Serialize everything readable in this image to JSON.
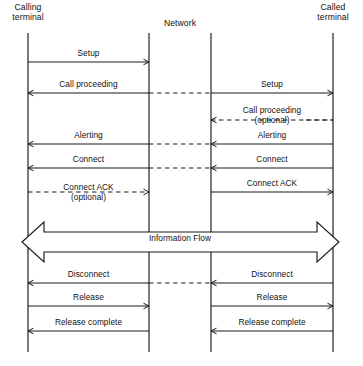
{
  "diagram": {
    "type": "sequence-diagram",
    "colors": {
      "line": "#1a1a1a",
      "text": "#111111",
      "background": "#ffffff"
    }
  },
  "lifelines": [
    {
      "id": "calling-terminal",
      "label": "Calling\nterminal",
      "x": 28,
      "label_x": 28,
      "label_y": 4,
      "top": 33,
      "bottom": 352
    },
    {
      "id": "network-left",
      "label": "",
      "x": 149,
      "top": 33,
      "bottom": 352
    },
    {
      "id": "network-right",
      "label": "",
      "x": 211,
      "top": 33,
      "bottom": 352
    },
    {
      "id": "called-terminal",
      "label": "Called\nterminal",
      "x": 333,
      "label_x": 333,
      "label_y": 4,
      "top": 33,
      "bottom": 352
    }
  ],
  "network_label": {
    "text": "Network",
    "x": 180,
    "y": 23
  },
  "messages": [
    {
      "id": "setup-left",
      "label": "Setup",
      "side": "left",
      "direction": "right",
      "style": "solid",
      "y": 62,
      "label_y": 49
    },
    {
      "id": "call-proceeding-left",
      "label": "Call proceeding",
      "side": "left",
      "direction": "left",
      "style": "solid",
      "y": 93,
      "label_y": 80
    },
    {
      "id": "setup-right",
      "label": "Setup",
      "side": "right",
      "direction": "right",
      "style": "solid",
      "y": 93,
      "label_y": 80
    },
    {
      "id": "call-proceeding-right",
      "label": "Call proceeding\n(optional)",
      "side": "right",
      "direction": "left",
      "style": "dashed",
      "y": 120,
      "label_y": 106
    },
    {
      "id": "alerting-left",
      "label": "Alerting",
      "side": "left",
      "direction": "left",
      "style": "solid",
      "y": 144,
      "label_y": 131
    },
    {
      "id": "alerting-right",
      "label": "Alerting",
      "side": "right",
      "direction": "left",
      "style": "solid",
      "y": 144,
      "label_y": 131
    },
    {
      "id": "connect-left",
      "label": "Connect",
      "side": "left",
      "direction": "left",
      "style": "solid",
      "y": 168,
      "label_y": 155
    },
    {
      "id": "connect-right",
      "label": "Connect",
      "side": "right",
      "direction": "left",
      "style": "solid",
      "y": 168,
      "label_y": 155
    },
    {
      "id": "connect-ack-left",
      "label": "Connect ACK\n(optional)",
      "side": "left",
      "direction": "right",
      "style": "dashed",
      "y": 192,
      "label_y": 183
    },
    {
      "id": "connect-ack-right",
      "label": "Connect ACK",
      "side": "right",
      "direction": "right",
      "style": "solid",
      "y": 192,
      "label_y": 179
    },
    {
      "id": "disconnect-left",
      "label": "Disconnect",
      "side": "left",
      "direction": "left",
      "style": "solid",
      "y": 283,
      "label_y": 270
    },
    {
      "id": "disconnect-right",
      "label": "Disconnect",
      "side": "right",
      "direction": "left",
      "style": "solid",
      "y": 283,
      "label_y": 270
    },
    {
      "id": "release-left",
      "label": "Release",
      "side": "left",
      "direction": "right",
      "style": "solid",
      "y": 306,
      "label_y": 293
    },
    {
      "id": "release-right",
      "label": "Release",
      "side": "right",
      "direction": "right",
      "style": "solid",
      "y": 306,
      "label_y": 293
    },
    {
      "id": "release-complete-left",
      "label": "Release complete",
      "side": "left",
      "direction": "left",
      "style": "solid",
      "y": 331,
      "label_y": 318
    },
    {
      "id": "release-complete-right",
      "label": "Release complete",
      "side": "right",
      "direction": "left",
      "style": "solid",
      "y": 331,
      "label_y": 318
    }
  ],
  "network_connectors": [
    {
      "id": "connector-setup",
      "y": 93,
      "style": "dashed"
    },
    {
      "id": "connector-alerting",
      "y": 144,
      "style": "dashed"
    },
    {
      "id": "connector-connect",
      "y": 168,
      "style": "dashed"
    },
    {
      "id": "connector-disconnect",
      "y": 283,
      "style": "dashed"
    }
  ],
  "stubs": [
    {
      "id": "stub-call-proceeding-optional",
      "y": 120,
      "x1": 306,
      "x2": 333,
      "style": "dashed"
    }
  ],
  "information_flow": {
    "label": "Information Flow",
    "label_x": 180,
    "label_y": 240,
    "left_tip": 22,
    "right_tip": 339,
    "top": 222,
    "bottom": 262,
    "shaft_top": 232,
    "shaft_bottom": 252
  }
}
